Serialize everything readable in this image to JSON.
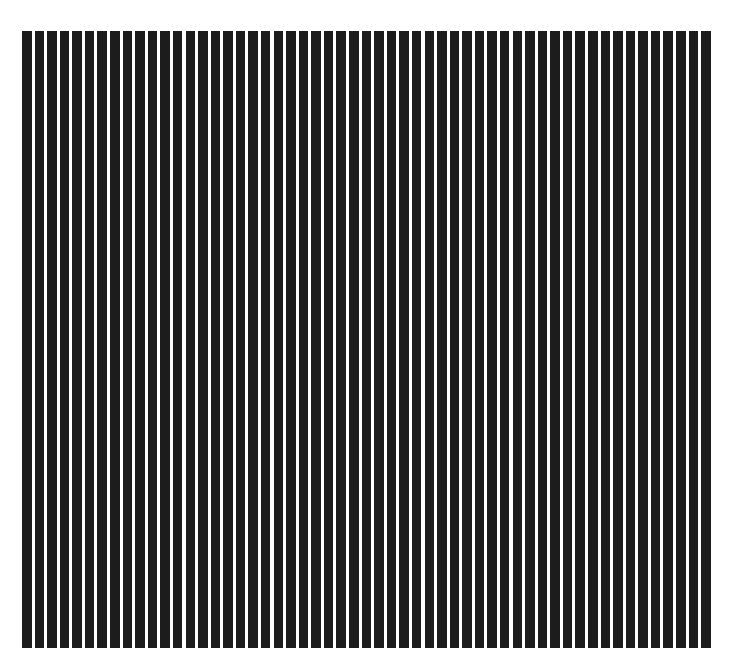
{
  "pattern": {
    "type": "vertical-stripes",
    "bar_count": 55,
    "bar_color": "#1c1c1c",
    "background_color": "#ffffff"
  }
}
